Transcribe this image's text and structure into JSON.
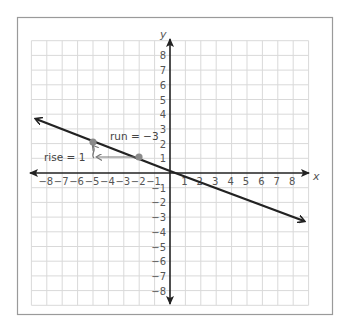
{
  "chart_data": {
    "type": "line",
    "title": "",
    "xlabel": "x",
    "ylabel": "y",
    "xlim": [
      -8,
      8
    ],
    "ylim": [
      -8,
      8
    ],
    "grid": true,
    "x_ticks": [
      "−8",
      "−7",
      "−6",
      "−5",
      "−4",
      "−3",
      "−2",
      "−1",
      "1",
      "2",
      "3",
      "4",
      "5",
      "6",
      "7",
      "8"
    ],
    "y_ticks": [
      "8",
      "7",
      "6",
      "5",
      "4",
      "3",
      "2",
      "1",
      "−1",
      "−2",
      "−3",
      "−4",
      "−5",
      "−6",
      "−7",
      "−8"
    ],
    "series": [
      {
        "name": "line",
        "slope": "-1/3",
        "passes_through": [
          [
            0,
            0
          ],
          [
            -2,
            1
          ],
          [
            -5,
            2
          ]
        ]
      }
    ],
    "points": [
      {
        "x": -5,
        "y": 2
      },
      {
        "x": -2,
        "y": 1
      }
    ],
    "annotations": [
      {
        "text": "run = −3",
        "from": [
          -2,
          1
        ],
        "to": [
          -5,
          1
        ]
      },
      {
        "text": "rise = 1",
        "from": [
          -5,
          1
        ],
        "to": [
          -5,
          2
        ]
      }
    ]
  },
  "labels": {
    "x_axis": "x",
    "y_axis": "y",
    "run": "run = −3",
    "rise": "rise = 1"
  },
  "colors": {
    "line": "#222222",
    "point": "#8a8a8a",
    "grid": "#d9d9d9",
    "frame": "#9a9a9a",
    "annotation_arrow": "#777777"
  }
}
